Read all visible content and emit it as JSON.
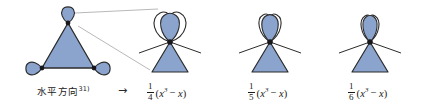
{
  "figure": {
    "caption_left": "水平方向",
    "caption_left_sup": "31)",
    "arrow": "→",
    "colors": {
      "fill": "#8ba4cd",
      "stroke": "#2b2b2b",
      "callout": "#9a9a9a",
      "text": "#1a1a1a"
    },
    "items": [
      {
        "name": "triangle-with-three-vertex-loops",
        "kind": "source-graph",
        "loops": 3,
        "label": "水平方向"
      },
      {
        "name": "theta-figure-4",
        "kind": "result-graph",
        "loops": 2,
        "formula": {
          "numerator": "1",
          "denominator": "4",
          "open_paren": "(",
          "var": "x",
          "power": "3",
          "minus": "−",
          "var2": "x",
          "close_paren": ")",
          "plain": "1/4 (x^3 − x)"
        }
      },
      {
        "name": "theta-figure-5",
        "kind": "result-graph",
        "loops": 1,
        "formula": {
          "numerator": "1",
          "denominator": "5",
          "open_paren": "(",
          "var": "x",
          "power": "3",
          "minus": "−",
          "var2": "x",
          "close_paren": ")",
          "plain": "1/5 (x^3 − x)"
        }
      },
      {
        "name": "theta-figure-6",
        "kind": "result-graph",
        "loops": 1,
        "formula": {
          "numerator": "1",
          "denominator": "6",
          "open_paren": "(",
          "var": "x",
          "power": "3",
          "minus": "−",
          "var2": "x",
          "close_paren": ")",
          "plain": "1/6 (x^3 − x)"
        }
      }
    ]
  }
}
